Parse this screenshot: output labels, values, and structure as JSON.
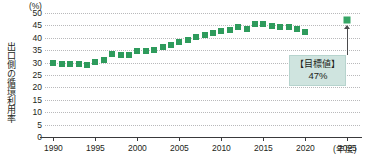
{
  "chart_data": {
    "type": "scatter",
    "title": "",
    "xlabel": "年度",
    "ylabel": "出口側の循環利用率",
    "unit_label": "(%)",
    "xlim": [
      1989,
      2026.5
    ],
    "ylim": [
      0,
      50
    ],
    "grid": true,
    "legend": "none",
    "series_color": "#2e9b5c",
    "yticks": [
      0,
      5,
      10,
      15,
      20,
      25,
      30,
      35,
      40,
      45,
      50
    ],
    "xticks": [
      1990,
      1995,
      2000,
      2005,
      2010,
      2015,
      2020,
      2025
    ],
    "series": [
      {
        "name": "出口側の循環利用率",
        "x": [
          1990,
          1991,
          1992,
          1993,
          1994,
          1995,
          1996,
          1997,
          1998,
          1999,
          2000,
          2001,
          2002,
          2003,
          2004,
          2005,
          2006,
          2007,
          2008,
          2009,
          2010,
          2011,
          2012,
          2013,
          2014,
          2015,
          2016,
          2017,
          2018,
          2019,
          2020
        ],
        "values": [
          30.0,
          29.5,
          29.4,
          29.3,
          29.0,
          30.3,
          31.2,
          33.5,
          33.2,
          33.0,
          34.8,
          34.5,
          35.2,
          36.4,
          37.2,
          38.3,
          39.2,
          40.2,
          41.0,
          41.8,
          42.6,
          43.0,
          44.2,
          43.6,
          45.6,
          45.5,
          44.8,
          44.4,
          44.2,
          43.6,
          42.5
        ]
      },
      {
        "name": "目標値",
        "x": [
          2025
        ],
        "values": [
          47.0
        ]
      }
    ],
    "annotations": [
      {
        "label_line1": "【目標値】",
        "label_line2": "47%",
        "x": 2025,
        "y": 47.0
      }
    ]
  },
  "axis": {
    "unit_label": "(%)",
    "y_title": "出口側の循環利用率",
    "x_unit": "(年度)"
  },
  "callout": {
    "line1": "【目標値】",
    "line2": "47%"
  }
}
